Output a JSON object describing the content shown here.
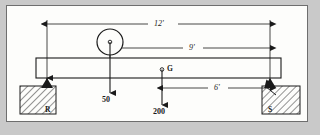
{
  "figure": {
    "type": "statics-beam-free-body-diagram"
  },
  "beam": {
    "label": "beam",
    "left_x": 36,
    "right_x": 281,
    "top_y": 58,
    "bottom_y": 78
  },
  "supports": [
    {
      "name": "left-support",
      "label": "R",
      "kind": "pin-support-hatched-block",
      "x": 47
    },
    {
      "name": "right-support",
      "label": "S",
      "kind": "pin-support-hatched-block",
      "x": 270
    }
  ],
  "loads": [
    {
      "name": "load-50",
      "label": "50",
      "direction": "down",
      "x": 110,
      "applied_at": "roller-circle-center"
    },
    {
      "name": "load-200",
      "label": "200",
      "direction": "down",
      "x": 162,
      "applied_at": "point-G"
    }
  ],
  "points": [
    {
      "name": "point-g",
      "label": "G",
      "x": 162,
      "y": 70
    }
  ],
  "roller": {
    "name": "roller-circle",
    "center_x": 110,
    "center_y": 42,
    "radius": 13
  },
  "dimensions": [
    {
      "name": "dimension-12ft",
      "label": "12'",
      "from_x": 47,
      "to_x": 270,
      "y": 24,
      "arrows": "both"
    },
    {
      "name": "dimension-9ft",
      "label": "9'",
      "from_x": 110,
      "to_x": 270,
      "y": 48,
      "arrows": "both"
    },
    {
      "name": "dimension-6ft",
      "label": "6'",
      "from_x": 162,
      "to_x": 270,
      "y": 88,
      "arrows": "both"
    }
  ],
  "colors": {
    "ink": "#1a1a1a",
    "paper": "#fdfdfb",
    "surround": "#c9c9c9",
    "frame": "#6e6e6e",
    "hatch": "#3a3a3a"
  },
  "labels": {
    "dim_12": "12'",
    "dim_9": "9'",
    "dim_6": "6'",
    "load_50": "50",
    "load_200": "200",
    "point_g": "G",
    "support_r": "R",
    "support_s": "S"
  }
}
